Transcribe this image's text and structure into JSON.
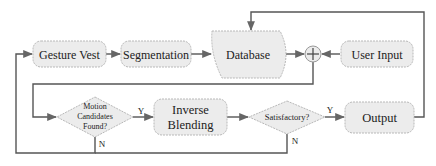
{
  "diagram": {
    "nodes": {
      "gesture_vest": "Gesture Vest",
      "segmentation": "Segmentation",
      "database": "Database",
      "plus": "+",
      "user_input": "User Input",
      "motion_candidates_line1": "Motion",
      "motion_candidates_line2": "Candidates",
      "motion_candidates_line3": "Found?",
      "inverse_blending_line1": "Inverse",
      "inverse_blending_line2": "Blending",
      "satisfactory": "Satisfactory?",
      "output": "Output"
    },
    "edge_labels": {
      "motion_yes": "Y",
      "motion_no": "N",
      "satisfactory_yes": "Y",
      "satisfactory_no": "N"
    },
    "colors": {
      "box_fill": "#ececec",
      "box_stroke": "#b8b8b8",
      "line": "#555555"
    }
  }
}
